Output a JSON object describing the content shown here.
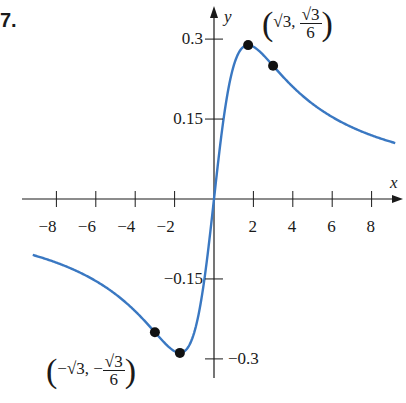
{
  "problem_number": "7.",
  "chart_data": {
    "type": "line",
    "title": "",
    "function": "f(x) = x / (x^2 + 3)",
    "xlabel": "x",
    "ylabel": "y",
    "xlim": [
      -9.2,
      9.2
    ],
    "ylim": [
      -0.33,
      0.33
    ],
    "x_ticks": [
      -8,
      -6,
      -4,
      -2,
      2,
      4,
      6,
      8
    ],
    "x_tick_labels": [
      "−8",
      "−6",
      "−4",
      "−2",
      "2",
      "4",
      "6",
      "8"
    ],
    "y_ticks": [
      0.3,
      0.15,
      -0.15,
      -0.3
    ],
    "y_tick_labels": [
      "0.3",
      "0.15",
      "−0.15",
      "−0.3"
    ],
    "grid": false,
    "series": [
      {
        "name": "f(x)",
        "color": "#3a78c2",
        "x": [
          -9,
          -8,
          -7,
          -6,
          -5,
          -4,
          -3,
          -2,
          -1.732,
          -1,
          0,
          1,
          1.732,
          2,
          3,
          4,
          5,
          6,
          7,
          8,
          9
        ],
        "values": [
          -0.107,
          -0.119,
          -0.135,
          -0.154,
          -0.179,
          -0.211,
          -0.25,
          -0.286,
          -0.289,
          -0.25,
          0,
          0.25,
          0.289,
          0.286,
          0.25,
          0.211,
          0.179,
          0.154,
          0.135,
          0.119,
          0.107
        ]
      }
    ],
    "marked_points": [
      {
        "x": -3,
        "y": -0.25,
        "label": ""
      },
      {
        "x": -1.732,
        "y": -0.2887,
        "label": "(−√3, −√3/6)"
      },
      {
        "x": 1.732,
        "y": 0.2887,
        "label": "(√3, √3/6)"
      },
      {
        "x": 3,
        "y": 0.25,
        "label": ""
      }
    ]
  },
  "annotations": {
    "max_label": {
      "x": "√3",
      "num": "√3",
      "den": "6"
    },
    "min_label": {
      "x": "−√3",
      "num": "√3",
      "den": "6",
      "neg": "−"
    }
  }
}
